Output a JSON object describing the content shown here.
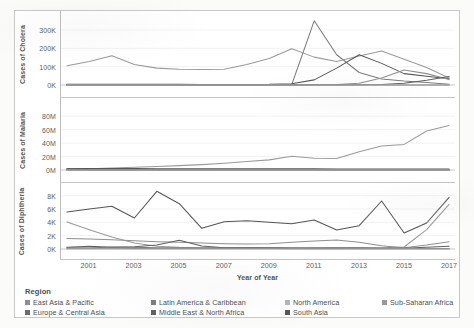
{
  "figure": {
    "xaxis_title": "Year of Year",
    "x_tick_labels": [
      "2001",
      "2003",
      "2005",
      "2007",
      "2009",
      "2011",
      "2013",
      "2015",
      "2017"
    ]
  },
  "legend": {
    "title": "Region",
    "items": [
      {
        "label": "East Asia & Pacific",
        "color": "#8f8f8f"
      },
      {
        "label": "Europe & Central Asia",
        "color": "#6d6d6d"
      },
      {
        "label": "Latin America & Caribbean",
        "color": "#7b7b7b"
      },
      {
        "label": "Middle East & North Africa",
        "color": "#5f5f5f"
      },
      {
        "label": "North America",
        "color": "#b5b5b5"
      },
      {
        "label": "South Asia",
        "color": "#565656"
      },
      {
        "label": "Sub-Saharan Africa",
        "color": "#9a9a9a"
      }
    ]
  },
  "chart_data": [
    {
      "type": "line",
      "title": "",
      "ylabel": "Cases of Cholera",
      "xlabel": "Year of Year",
      "x": [
        2000,
        2001,
        2002,
        2003,
        2004,
        2005,
        2006,
        2007,
        2008,
        2009,
        2010,
        2011,
        2012,
        2013,
        2014,
        2015,
        2016,
        2017
      ],
      "ylim": [
        0,
        360000
      ],
      "yticks": [
        0,
        100000,
        200000,
        300000
      ],
      "ytick_labels": [
        "0K",
        "100K",
        "200K",
        "300K"
      ],
      "grid": true,
      "legend_position": "bottom",
      "series": [
        {
          "name": "Sub-Saharan Africa",
          "color": "#9a9a9a",
          "values": [
            105000,
            128000,
            160000,
            112000,
            92000,
            86000,
            84000,
            86000,
            112000,
            145000,
            198000,
            152000,
            128000,
            158000,
            185000,
            140000,
            95000,
            38000
          ]
        },
        {
          "name": "Latin America & Caribbean",
          "color": "#7b7b7b",
          "values": [
            1500,
            1400,
            1200,
            1000,
            900,
            800,
            700,
            600,
            500,
            400,
            2000,
            350000,
            165000,
            68000,
            33000,
            22000,
            14000,
            4000
          ]
        },
        {
          "name": "South Asia",
          "color": "#565656",
          "values": [
            4000,
            4200,
            4000,
            3800,
            3600,
            3400,
            3200,
            3000,
            3200,
            3400,
            7000,
            28000,
            92000,
            165000,
            118000,
            62000,
            48000,
            34000
          ]
        },
        {
          "name": "East Asia & Pacific",
          "color": "#8f8f8f",
          "values": [
            2200,
            2000,
            1800,
            1700,
            1600,
            1500,
            1400,
            1300,
            1400,
            1600,
            2000,
            2500,
            3000,
            9000,
            38000,
            82000,
            62000,
            30000
          ]
        },
        {
          "name": "Middle East & North Africa",
          "color": "#5f5f5f",
          "values": [
            800,
            700,
            650,
            600,
            550,
            500,
            480,
            460,
            440,
            420,
            400,
            500,
            700,
            1200,
            3000,
            9000,
            26000,
            46000
          ]
        },
        {
          "name": "Europe & Central Asia",
          "color": "#6d6d6d",
          "values": [
            600,
            550,
            500,
            480,
            450,
            420,
            400,
            380,
            360,
            340,
            320,
            300,
            280,
            260,
            240,
            220,
            200,
            180
          ]
        },
        {
          "name": "North America",
          "color": "#b5b5b5",
          "values": [
            30,
            25,
            20,
            22,
            18,
            15,
            14,
            12,
            10,
            9,
            8,
            10,
            12,
            9,
            8,
            7,
            6,
            5
          ]
        }
      ]
    },
    {
      "type": "line",
      "title": "",
      "ylabel": "Cases of Malaria",
      "xlabel": "Year of Year",
      "x": [
        2000,
        2001,
        2002,
        2003,
        2004,
        2005,
        2006,
        2007,
        2008,
        2009,
        2010,
        2011,
        2012,
        2013,
        2014,
        2015,
        2016,
        2017
      ],
      "ylim": [
        0,
        95000000
      ],
      "yticks": [
        0,
        20000000,
        40000000,
        60000000,
        80000000
      ],
      "ytick_labels": [
        "0M",
        "20M",
        "40M",
        "60M",
        "80M"
      ],
      "grid": true,
      "legend_position": "bottom",
      "series": [
        {
          "name": "Sub-Saharan Africa",
          "color": "#9a9a9a",
          "values": [
            1200000,
            2000000,
            3000000,
            4000000,
            5200000,
            6500000,
            8000000,
            10000000,
            12500000,
            15000000,
            20500000,
            17500000,
            17000000,
            27000000,
            35500000,
            38000000,
            58000000,
            66000000
          ]
        },
        {
          "name": "South Asia",
          "color": "#565656",
          "values": [
            2200000,
            2200000,
            2100000,
            2050000,
            2000000,
            1950000,
            1900000,
            1850000,
            1800000,
            1750000,
            1700000,
            1650000,
            1600000,
            1550000,
            1500000,
            1450000,
            1400000,
            1350000
          ]
        },
        {
          "name": "East Asia & Pacific",
          "color": "#8f8f8f",
          "values": [
            900000,
            880000,
            850000,
            830000,
            800000,
            780000,
            750000,
            720000,
            700000,
            680000,
            650000,
            620000,
            600000,
            580000,
            550000,
            520000,
            500000,
            480000
          ]
        },
        {
          "name": "Latin America & Caribbean",
          "color": "#7b7b7b",
          "values": [
            700000,
            680000,
            650000,
            620000,
            600000,
            570000,
            540000,
            510000,
            480000,
            450000,
            420000,
            400000,
            380000,
            360000,
            340000,
            320000,
            300000,
            280000
          ]
        },
        {
          "name": "Middle East & North Africa",
          "color": "#5f5f5f",
          "values": [
            200000,
            190000,
            180000,
            175000,
            170000,
            165000,
            160000,
            155000,
            150000,
            145000,
            140000,
            135000,
            130000,
            125000,
            120000,
            115000,
            110000,
            105000
          ]
        },
        {
          "name": "Europe & Central Asia",
          "color": "#6d6d6d",
          "values": [
            60000,
            55000,
            50000,
            45000,
            40000,
            36000,
            32000,
            28000,
            24000,
            20000,
            17000,
            14000,
            12000,
            10000,
            9000,
            8000,
            7000,
            6000
          ]
        },
        {
          "name": "North America",
          "color": "#b5b5b5",
          "values": [
            1500,
            1450,
            1400,
            1350,
            1300,
            1250,
            1200,
            1150,
            1100,
            1050,
            1000,
            950,
            900,
            850,
            800,
            750,
            700,
            650
          ]
        }
      ]
    },
    {
      "type": "line",
      "title": "",
      "ylabel": "Cases of Diphtheria",
      "xlabel": "Year of Year",
      "x": [
        2000,
        2001,
        2002,
        2003,
        2004,
        2005,
        2006,
        2007,
        2008,
        2009,
        2010,
        2011,
        2012,
        2013,
        2014,
        2015,
        2016,
        2017
      ],
      "ylim": [
        0,
        9000
      ],
      "yticks": [
        0,
        2000,
        4000,
        6000,
        8000
      ],
      "ytick_labels": [
        "0K",
        "2K",
        "4K",
        "6K",
        "8K"
      ],
      "grid": true,
      "legend_position": "bottom",
      "series": [
        {
          "name": "South Asia",
          "color": "#565656",
          "values": [
            5550,
            6000,
            6400,
            4650,
            8650,
            6800,
            3100,
            4100,
            4250,
            4000,
            3800,
            4350,
            2850,
            3500,
            7200,
            2400,
            3900,
            7750
          ]
        },
        {
          "name": "Sub-Saharan Africa",
          "color": "#9a9a9a",
          "values": [
            4050,
            2900,
            1800,
            900,
            400,
            250,
            200,
            180,
            170,
            160,
            150,
            160,
            170,
            180,
            200,
            300,
            2900,
            6700
          ]
        },
        {
          "name": "East Asia & Pacific",
          "color": "#8f8f8f",
          "values": [
            1580,
            1500,
            1400,
            1250,
            1100,
            1000,
            900,
            800,
            750,
            800,
            1000,
            1200,
            1350,
            1000,
            500,
            200,
            600,
            1100
          ]
        },
        {
          "name": "Middle East & North Africa",
          "color": "#5f5f5f",
          "values": [
            250,
            400,
            250,
            350,
            600,
            1300,
            450,
            200,
            180,
            170,
            160,
            150,
            140,
            130,
            120,
            110,
            260,
            420
          ]
        },
        {
          "name": "Latin America & Caribbean",
          "color": "#7b7b7b",
          "values": [
            180,
            160,
            300,
            250,
            200,
            180,
            160,
            150,
            140,
            130,
            120,
            110,
            100,
            95,
            90,
            85,
            80,
            75
          ]
        },
        {
          "name": "Europe & Central Asia",
          "color": "#6d6d6d",
          "values": [
            120,
            110,
            100,
            95,
            90,
            85,
            80,
            75,
            70,
            65,
            60,
            58,
            55,
            52,
            50,
            48,
            45,
            42
          ]
        },
        {
          "name": "North America",
          "color": "#b5b5b5",
          "values": [
            8,
            7,
            6,
            6,
            5,
            5,
            4,
            4,
            4,
            3,
            3,
            3,
            3,
            2,
            2,
            2,
            2,
            2
          ]
        }
      ]
    }
  ]
}
